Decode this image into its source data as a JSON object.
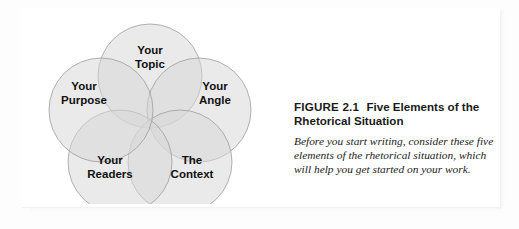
{
  "figure": {
    "caption": {
      "figure_number": "FIGURE 2.1",
      "title": "Five Elements of the Rhetorical Situation",
      "body": "Before you start writing, consider these five elements of the rhetorical situation, which will help you get started on your work."
    },
    "diagram": {
      "type": "venn-flower",
      "circle_fill": "#d7d7d7",
      "circle_stroke": "#9a9a9a",
      "label_color": "#111111",
      "elements": [
        {
          "id": "topic",
          "label_line1": "Your",
          "label_line2": "Topic",
          "cx": 116,
          "cy": 62,
          "r": 52,
          "label_x": 116,
          "label_y": 40
        },
        {
          "id": "angle",
          "label_line1": "Your",
          "label_line2": "Angle",
          "cx": 165,
          "cy": 96,
          "r": 52,
          "label_x": 181,
          "label_y": 76
        },
        {
          "id": "context",
          "label_line1": "The",
          "label_line2": "Context",
          "cx": 146,
          "cy": 148,
          "r": 52,
          "label_x": 158,
          "label_y": 150
        },
        {
          "id": "readers",
          "label_line1": "Your",
          "label_line2": "Readers",
          "cx": 86,
          "cy": 148,
          "r": 52,
          "label_x": 76,
          "label_y": 150
        },
        {
          "id": "purpose",
          "label_line1": "Your",
          "label_line2": "Purpose",
          "cx": 67,
          "cy": 96,
          "r": 52,
          "label_x": 50,
          "label_y": 76
        }
      ]
    }
  }
}
